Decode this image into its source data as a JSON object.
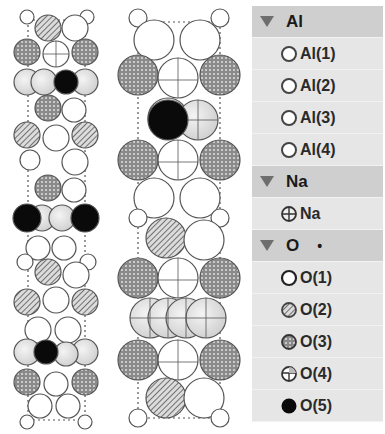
{
  "legend": {
    "groups": [
      {
        "label": "Al",
        "marker": "",
        "items": [
          {
            "label": "Al(1)",
            "symbol": "open-circle"
          },
          {
            "label": "Al(2)",
            "symbol": "open-circle"
          },
          {
            "label": "Al(3)",
            "symbol": "open-circle"
          },
          {
            "label": "Al(4)",
            "symbol": "open-circle"
          }
        ]
      },
      {
        "label": "Na",
        "marker": "",
        "items": [
          {
            "label": "Na",
            "symbol": "crossed-circle"
          }
        ]
      },
      {
        "label": "O",
        "marker": "•",
        "items": [
          {
            "label": "O(1)",
            "symbol": "white-circle"
          },
          {
            "label": "O(2)",
            "symbol": "hatched-circle"
          },
          {
            "label": "O(3)",
            "symbol": "dotted-circle"
          },
          {
            "label": "O(4)",
            "symbol": "quartered-circle"
          },
          {
            "label": "O(5)",
            "symbol": "black-circle"
          }
        ]
      }
    ]
  },
  "structures": [
    {
      "name": "narrow-projection",
      "atom_types": [
        "Al",
        "Na",
        "O(1)",
        "O(2)",
        "O(3)",
        "O(4)",
        "O(5)"
      ]
    },
    {
      "name": "wide-projection",
      "atom_types": [
        "Al",
        "Na",
        "O(1)",
        "O(2)",
        "O(3)",
        "O(4)",
        "O(5)"
      ]
    }
  ],
  "colors": {
    "group_header_bg": "#cfcfcf",
    "item_bg": "#e6e6e6",
    "triangle": "#6e6e6e",
    "atom_outline": "#555555",
    "atom_light": "#e8e8e8",
    "atom_black": "#0a0a0a"
  }
}
